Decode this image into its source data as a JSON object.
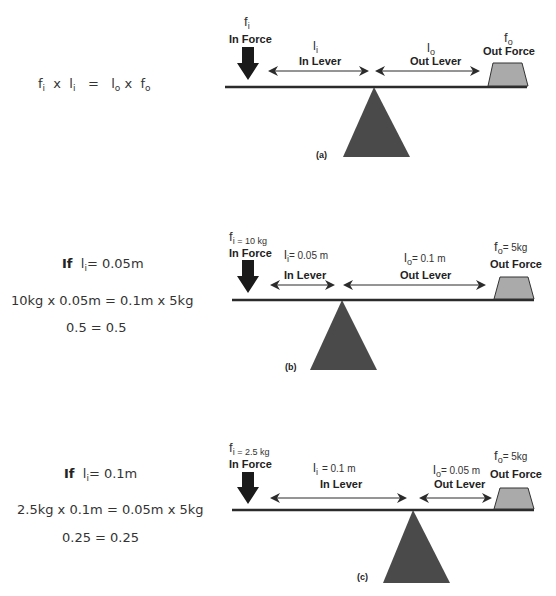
{
  "colors": {
    "beam": "#2b2b2b",
    "fulcrum": "#4a4a4a",
    "weight_fill": "#aaaaaa",
    "arrow": "#1a1a1a",
    "text": "#333333"
  },
  "panels": [
    {
      "tag": "(a)",
      "equation": {
        "lhs_f": "f",
        "lhs_f_sub": "i",
        "times1": "x",
        "lhs_l": "l",
        "lhs_l_sub": "i",
        "equals": "=",
        "rhs_l": "l",
        "rhs_l_sub": "o",
        "times2": "x",
        "rhs_f": "f",
        "rhs_f_sub": "o"
      },
      "in_force": {
        "symbol": "f",
        "sub": "i",
        "value": "",
        "label": "In Force"
      },
      "in_lever": {
        "symbol": "l",
        "sub": "i",
        "value": "",
        "label": "In Lever"
      },
      "out_lever": {
        "symbol": "l",
        "sub": "o",
        "value": "",
        "label": "Out Lever"
      },
      "out_force": {
        "symbol": "f",
        "sub": "o",
        "value": "",
        "label": "Out Force"
      }
    },
    {
      "tag": "(b)",
      "condition": {
        "if": "If",
        "symbol": "l",
        "sub": "i",
        "value": "= 0.05m"
      },
      "equation_line": "10kg  x  0.05m  =  0.1m x 5kg",
      "result_line": "0.5  =  0.5",
      "in_force": {
        "symbol": "f",
        "sub": "i = 10 kg",
        "label": "In Force"
      },
      "in_lever": {
        "symbol": "l",
        "sub": "i",
        "value": "= 0.05 m",
        "label": "In Lever"
      },
      "out_lever": {
        "symbol": "l",
        "sub": "o",
        "value": "= 0.1 m",
        "label": "Out Lever"
      },
      "out_force": {
        "symbol": "f",
        "sub": "o",
        "value": "=  5kg",
        "label": "Out Force"
      }
    },
    {
      "tag": "(c)",
      "condition": {
        "if": "If",
        "symbol": "l",
        "sub": "i",
        "value": "= 0.1m"
      },
      "equation_line": "2.5kg  x  0.1m  =  0.05m x 5kg",
      "result_line": "0.25  =  0.25",
      "in_force": {
        "symbol": "f",
        "sub": "i = 2.5 kg",
        "label": "In Force"
      },
      "in_lever": {
        "symbol": "l",
        "sub": "i",
        "value": "= 0.1 m",
        "label": "In Lever"
      },
      "out_lever": {
        "symbol": "l",
        "sub": "o",
        "value": "= 0.05 m",
        "label": "Out Lever"
      },
      "out_force": {
        "symbol": "f",
        "sub": "o",
        "value": "=  5kg",
        "label": "Out Force"
      }
    }
  ]
}
